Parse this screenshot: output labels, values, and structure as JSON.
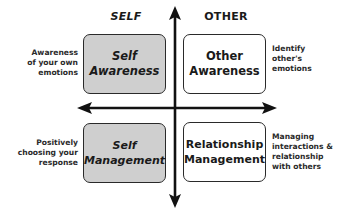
{
  "diagram": {
    "columns": {
      "self": "SELF",
      "other": "OTHER"
    },
    "quadrants": [
      {
        "id": "self-awareness",
        "line1": "Self",
        "line2": "Awareness",
        "fill": "#cfcfcf",
        "description": [
          "Awareness",
          "of your own",
          "emotions"
        ]
      },
      {
        "id": "other-awareness",
        "line1": "Other",
        "line2": "Awareness",
        "fill": "#ffffff",
        "description": [
          "Identify",
          "other's",
          "emotions"
        ]
      },
      {
        "id": "self-management",
        "line1": "Self",
        "line2": "Management",
        "fill": "#cfcfcf",
        "description": [
          "Positively",
          "choosing your",
          "response"
        ]
      },
      {
        "id": "relationship-management",
        "line1": "Relationship",
        "line2": "Management",
        "fill": "#ffffff",
        "description": [
          "Managing",
          "interactions &",
          "relationship",
          "with others"
        ]
      }
    ],
    "axes": {
      "vertical": "double-headed arrow (up/down)",
      "horizontal": "double-headed arrow (left/right)",
      "color": "#111111"
    }
  }
}
